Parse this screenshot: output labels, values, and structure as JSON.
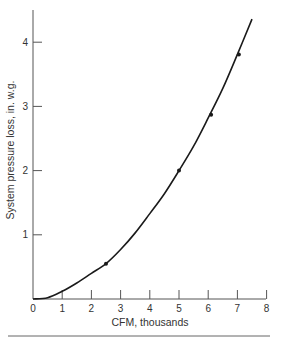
{
  "chart_data": {
    "type": "line",
    "title": "",
    "xlabel": "CFM, thousands",
    "ylabel": "System pressure loss, in. w.g.",
    "xlim": [
      0,
      8
    ],
    "ylim": [
      0,
      4.5
    ],
    "x_ticks": [
      "0",
      "1",
      "2",
      "3",
      "4",
      "5",
      "6",
      "7",
      "8"
    ],
    "y_ticks": [
      "1",
      "2",
      "3",
      "4"
    ],
    "grid": false,
    "legend": null,
    "series": [
      {
        "name": "System curve",
        "curve": [
          [
            0,
            0
          ],
          [
            0.5,
            0.02
          ],
          [
            1,
            0.12
          ],
          [
            1.5,
            0.25
          ],
          [
            2,
            0.4
          ],
          [
            2.5,
            0.55
          ],
          [
            3,
            0.77
          ],
          [
            3.5,
            1.03
          ],
          [
            4,
            1.33
          ],
          [
            4.5,
            1.64
          ],
          [
            5,
            2.0
          ],
          [
            5.5,
            2.38
          ],
          [
            6,
            2.82
          ],
          [
            6.5,
            3.28
          ],
          [
            7,
            3.81
          ],
          [
            7.5,
            4.36
          ]
        ],
        "markers": [
          [
            2.5,
            0.55
          ],
          [
            5,
            2.0
          ],
          [
            6.1,
            2.87
          ],
          [
            7.05,
            3.81
          ]
        ]
      }
    ]
  },
  "labels": {
    "x_title": "CFM, thousands",
    "y_title": "System pressure loss, in. w.g.",
    "x_ticks": [
      "0",
      "1",
      "2",
      "3",
      "4",
      "5",
      "6",
      "7",
      "8"
    ],
    "y_ticks": [
      "1",
      "2",
      "3",
      "4"
    ]
  },
  "colors": {
    "line": "#1a1a1a",
    "axis": "#555555",
    "rule": "#666666"
  }
}
